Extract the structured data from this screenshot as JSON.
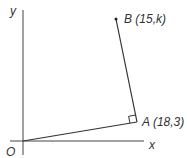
{
  "diagram": {
    "axes": {
      "x_label": "x",
      "y_label": "y",
      "origin_label": "O"
    },
    "points": [
      {
        "name": "A",
        "label": "A (18,3)"
      },
      {
        "name": "B",
        "label": "B (15,k)"
      }
    ],
    "segments": [
      "OA",
      "AB"
    ],
    "annotations": {
      "right_angle_at": "A"
    },
    "colors": {
      "line": "#333333",
      "text": "#333333"
    }
  }
}
